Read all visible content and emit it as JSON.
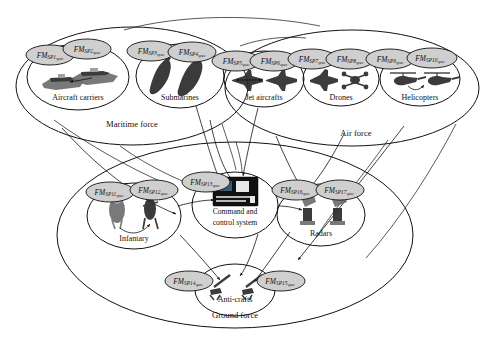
{
  "diagram": {
    "type": "concept-diagram"
  },
  "forces": [
    {
      "id": "maritime",
      "label": "Maritime force",
      "groups": [
        {
          "id": "aircraft-carriers",
          "label": "Aircraft carriers",
          "specs": [
            {
              "id": "sp1",
              "base": "FM",
              "sub": "SP1",
              "suffix": "spec",
              "full": "FM_SP1_spec"
            },
            {
              "id": "sp2",
              "base": "FM",
              "sub": "SP2",
              "suffix": "spec",
              "full": "FM_SP2_spec"
            }
          ]
        },
        {
          "id": "submarines",
          "label": "Submarines",
          "specs": [
            {
              "id": "sp3",
              "base": "FM",
              "sub": "SP3",
              "suffix": "spec",
              "full": "FM_SP3_spec"
            },
            {
              "id": "sp4",
              "base": "FM",
              "sub": "SP4",
              "suffix": "spec",
              "full": "FM_SP4_spec"
            }
          ]
        }
      ]
    },
    {
      "id": "air",
      "label": "Air force",
      "groups": [
        {
          "id": "jet-aircrafts",
          "label": "Jet aircrafts",
          "specs": [
            {
              "id": "sp5",
              "base": "FM",
              "sub": "SP5",
              "suffix": "spec",
              "full": "FM_SP5_spec"
            },
            {
              "id": "sp6",
              "base": "FM",
              "sub": "SP6",
              "suffix": "spec",
              "full": "FM_SP6_spec"
            }
          ]
        },
        {
          "id": "drones",
          "label": "Drones",
          "specs": [
            {
              "id": "sp7",
              "base": "FM",
              "sub": "SP7",
              "suffix": "spec",
              "full": "FM_SP7_spec"
            },
            {
              "id": "sp8",
              "base": "FM",
              "sub": "SP8",
              "suffix": "spec",
              "full": "FM_SP8_spec"
            }
          ]
        },
        {
          "id": "helicopters",
          "label": "Helicopters",
          "specs": [
            {
              "id": "sp9",
              "base": "FM",
              "sub": "SP9",
              "suffix": "spec",
              "full": "FM_SP9_spec"
            },
            {
              "id": "sp10",
              "base": "FM",
              "sub": "SP10",
              "suffix": "spec",
              "full": "FM_SP10_spec"
            }
          ]
        }
      ]
    },
    {
      "id": "ground",
      "label": "Ground force",
      "groups": [
        {
          "id": "infantary",
          "label": "Infantary",
          "specs": [
            {
              "id": "sp11",
              "base": "FM",
              "sub": "SP11",
              "suffix": "spec",
              "full": "FM_SP11_spec"
            },
            {
              "id": "sp12",
              "base": "FM",
              "sub": "SP12",
              "suffix": "spec",
              "full": "FM_SP12_spec"
            }
          ]
        },
        {
          "id": "command-and-control-system",
          "label": "Command and control system",
          "label_line1": "Command and",
          "label_line2": "control system",
          "specs": [
            {
              "id": "sp13",
              "base": "FM",
              "sub": "SP13",
              "suffix": "spec",
              "full": "FM_SP13_spec"
            }
          ]
        },
        {
          "id": "radars",
          "label": "Radars",
          "specs": [
            {
              "id": "sp16",
              "base": "FM",
              "sub": "SP16",
              "suffix": "spec",
              "full": "FM_SP16_spec"
            },
            {
              "id": "sp17",
              "base": "FM",
              "sub": "SP17",
              "suffix": "spec",
              "full": "FM_SP17_spec"
            }
          ]
        },
        {
          "id": "anti-crafts",
          "label": "Anti-crafts",
          "specs": [
            {
              "id": "sp14",
              "base": "FM",
              "sub": "SP14",
              "suffix": "spec",
              "full": "FM_SP14_spec"
            },
            {
              "id": "sp15",
              "base": "FM",
              "sub": "SP15",
              "suffix": "spec",
              "full": "FM_SP15_spec"
            }
          ]
        }
      ]
    }
  ],
  "icons": {
    "aircraft_carrier": "aircraft-carrier-icon",
    "submarine": "submarine-icon",
    "jet": "jet-aircraft-icon",
    "drone": "drone-icon",
    "helicopter": "helicopter-icon",
    "soldier": "soldier-icon",
    "screen": "command-screen-icon",
    "radar": "radar-dish-icon",
    "antiaircraft_gun": "anti-aircraft-gun-icon"
  },
  "colors": {
    "stroke": "#111111",
    "spec_fill": "#cfcfcf",
    "background": "#ffffff",
    "sprite_dark": "#2b2b2b",
    "sprite_mid": "#6e6e6e",
    "sprite_light": "#9a9a9a"
  }
}
